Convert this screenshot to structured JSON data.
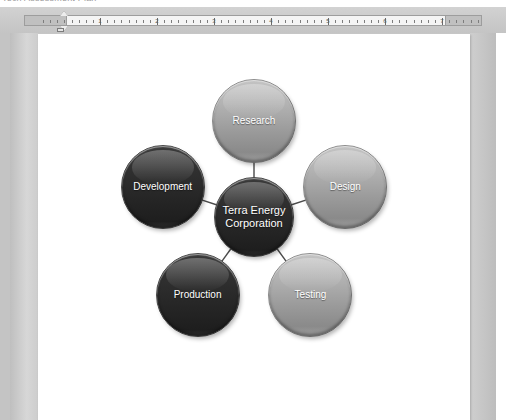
{
  "app": {
    "background_color": "#c9c9c9",
    "page_color": "#ffffff",
    "top_clipped_text": "Tech Assessment Plan"
  },
  "ruler": {
    "unit_labels": [
      "1",
      "2",
      "3",
      "4",
      "5",
      "6",
      "7"
    ],
    "left_indent_marker": "indent-marker",
    "visible": true
  },
  "chart_data": {
    "type": "diagram",
    "layout": "radial-hub-and-spoke",
    "title": "Terra Energy Corporation",
    "center": {
      "label": "Terra Energy Corporation",
      "style": "dark",
      "fill": "#2a2a2a",
      "text_color": "#ffffff"
    },
    "nodes": [
      {
        "label": "Research",
        "style": "light",
        "fill": "#a8a8a8",
        "text_color": "#ffffff",
        "angle_deg": 90,
        "position": "top"
      },
      {
        "label": "Design",
        "style": "light",
        "fill": "#a8a8a8",
        "text_color": "#ffffff",
        "angle_deg": 18,
        "position": "right"
      },
      {
        "label": "Testing",
        "style": "light",
        "fill": "#a8a8a8",
        "text_color": "#ffffff",
        "angle_deg": -54,
        "position": "bottom-right"
      },
      {
        "label": "Production",
        "style": "dark",
        "fill": "#2a2a2a",
        "text_color": "#ffffff",
        "angle_deg": -126,
        "position": "bottom-left"
      },
      {
        "label": "Development",
        "style": "dark",
        "fill": "#2a2a2a",
        "text_color": "#ffffff",
        "angle_deg": 162,
        "position": "left"
      }
    ],
    "edges": [
      {
        "from": "Terra Energy Corporation",
        "to": "Research"
      },
      {
        "from": "Terra Energy Corporation",
        "to": "Design"
      },
      {
        "from": "Terra Energy Corporation",
        "to": "Testing"
      },
      {
        "from": "Terra Energy Corporation",
        "to": "Production"
      },
      {
        "from": "Terra Energy Corporation",
        "to": "Development"
      }
    ],
    "edge_color": "#4a4a4a",
    "background": "#ffffff"
  }
}
